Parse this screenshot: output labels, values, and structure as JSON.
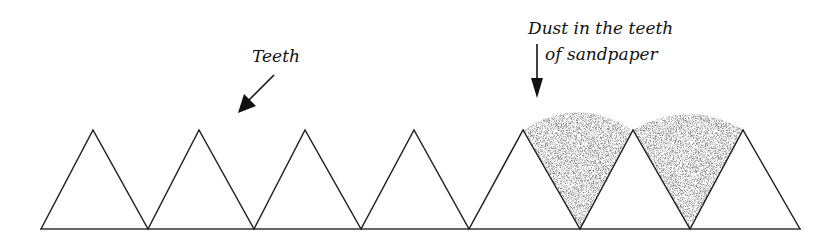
{
  "labels": {
    "teeth": "Teeth",
    "dust_line1": "Dust in the teeth",
    "dust_line2": "of sandpaper"
  },
  "figure": {
    "tooth_count": 7,
    "dust_filled_gaps": 2,
    "stroke_color": "#222222",
    "dust_color": "#555555",
    "background": "#ffffff"
  }
}
